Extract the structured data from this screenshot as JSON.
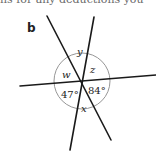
{
  "header": {
    "cut_text": "ns for any deductions you"
  },
  "part_label": "b",
  "diagram": {
    "angles": {
      "y": "y",
      "z": "z",
      "w": "w",
      "x": "x",
      "a1": "47°",
      "a2": "84°"
    },
    "colors": {
      "line": "#1a1a1a",
      "arc": "#8a8a8a"
    }
  }
}
